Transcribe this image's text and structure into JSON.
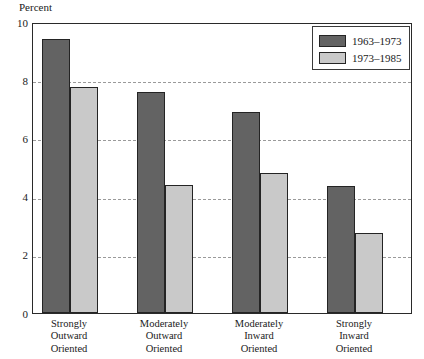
{
  "chart_data": {
    "type": "bar",
    "title": "",
    "xlabel": "",
    "ylabel": "Percent",
    "ylim": [
      0,
      10
    ],
    "yticks": [
      0,
      2,
      4,
      6,
      8,
      10
    ],
    "ytick_labels": [
      "0",
      "2",
      "4",
      "6",
      "8",
      "10"
    ],
    "grid": true,
    "grid_axis": "y",
    "legend_position": "top-right",
    "categories": [
      "Strongly\nOutward\nOriented",
      "Moderately\nOutward\nOriented",
      "Moderately\nInward\nOriented",
      "Strongly\nInward\nOriented"
    ],
    "category_lines": [
      [
        "Strongly",
        "Outward",
        "Oriented"
      ],
      [
        "Moderately",
        "Outward",
        "Oriented"
      ],
      [
        "Moderately",
        "Inward",
        "Oriented"
      ],
      [
        "Strongly",
        "Inward",
        "Oriented"
      ]
    ],
    "series": [
      {
        "name": "1963–1973",
        "color": "#636363",
        "values": [
          9.4,
          7.6,
          6.9,
          4.35
        ]
      },
      {
        "name": "1973–1985",
        "color": "#c9c9c9",
        "values": [
          7.75,
          4.4,
          4.8,
          2.75
        ]
      }
    ]
  },
  "axis": {
    "y_label": "Percent"
  },
  "legend": {
    "entries": [
      {
        "label": "1963–1973",
        "swatch": "dark-gray-swatch"
      },
      {
        "label": "1973–1985",
        "swatch": "light-gray-swatch"
      }
    ]
  }
}
